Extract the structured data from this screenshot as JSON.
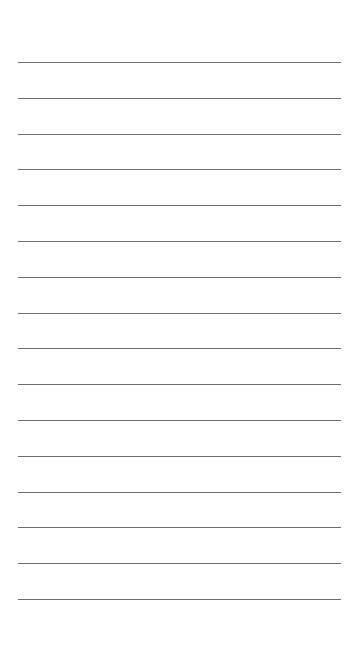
{
  "page": {
    "type": "lined-paper",
    "background": "#ffffff",
    "line_color": "#6e6e6e",
    "line_count": 16,
    "first_line_y": 62,
    "line_spacing": 35.8,
    "line_left": 18,
    "line_width": 323
  }
}
